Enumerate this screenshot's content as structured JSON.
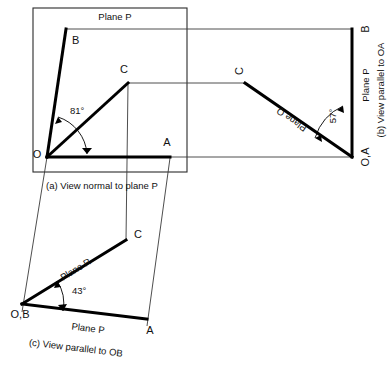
{
  "figure": {
    "type": "engineering-orthographic-projection",
    "background": "#ffffff",
    "ink_color": "#000000",
    "thin_line_color": "#3a3a3a"
  },
  "panel_a": {
    "caption": "(a)  View normal to plane P",
    "plane_label": "Plane P",
    "angle": "81°",
    "points": {
      "o": "O",
      "a": "A",
      "b": "B",
      "c": "C"
    }
  },
  "panel_b": {
    "caption": "(b) View parallel to OA",
    "plane_label_p": "Plane P",
    "plane_label_q": "Plane Q",
    "angle": "57°",
    "points": {
      "b": "B",
      "c": "C",
      "oa": "O,A"
    }
  },
  "panel_c": {
    "caption": "(c)  View parallel to OB",
    "plane_label_p": "Plane P",
    "plane_label_r": "Plane R",
    "angle": "43°",
    "points": {
      "ob": "O,B",
      "a": "A",
      "c": "C"
    }
  }
}
